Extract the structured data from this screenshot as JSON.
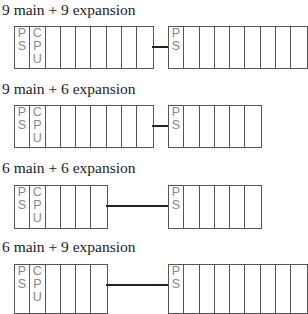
{
  "configs": [
    {
      "title": "9 main + 9 expansion",
      "main_slots": 9,
      "expansion_slots": 9
    },
    {
      "title": "9 main + 6 expansion",
      "main_slots": 9,
      "expansion_slots": 6
    },
    {
      "title": "6 main + 6 expansion",
      "main_slots": 6,
      "expansion_slots": 6
    },
    {
      "title": "6 main + 9 expansion",
      "main_slots": 6,
      "expansion_slots": 9
    }
  ],
  "labels": {
    "ps": "PS",
    "cpu": "CPU"
  }
}
